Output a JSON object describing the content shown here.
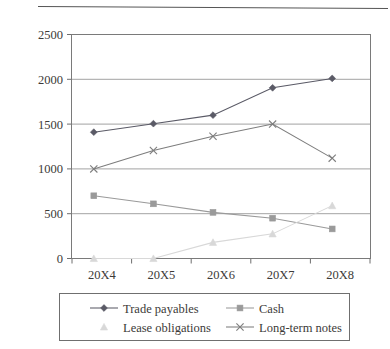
{
  "chart_data": {
    "type": "line",
    "title": "",
    "subtitle": "",
    "xlabel": "",
    "ylabel": "",
    "categories": [
      "20X4",
      "20X5",
      "20X6",
      "20X7",
      "20X8"
    ],
    "ylim": [
      0,
      2500
    ],
    "yticks": [
      0,
      500,
      1000,
      1500,
      2000,
      2500
    ],
    "ytick_labels": [
      "0",
      "500",
      "1000",
      "1500",
      "2000",
      "2500"
    ],
    "grid": true,
    "grid_axis": "y",
    "legend_position": "bottom",
    "series": [
      {
        "name": "Trade payables",
        "marker": "diamond",
        "color": "#5a5a66",
        "values": [
          1410,
          1505,
          1600,
          1905,
          2010
        ]
      },
      {
        "name": "Cash",
        "marker": "square",
        "color": "#9a9a9a",
        "values": [
          700,
          610,
          515,
          450,
          330
        ]
      },
      {
        "name": "Lease obligations",
        "marker": "triangle",
        "color": "#d8d8d8",
        "values": [
          0,
          0,
          180,
          275,
          590
        ]
      },
      {
        "name": "Long-term notes",
        "marker": "x",
        "color": "#7d7d7d",
        "values": [
          1000,
          1205,
          1365,
          1500,
          1120
        ]
      }
    ]
  },
  "legend": {
    "entries": [
      {
        "label": "Trade payables",
        "marker": "diamond",
        "color": "#5a5a66"
      },
      {
        "label": "Cash",
        "marker": "square",
        "color": "#9a9a9a"
      },
      {
        "label": "Lease obligations",
        "marker": "triangle",
        "color": "#d8d8d8"
      },
      {
        "label": "Long-term notes",
        "marker": "x",
        "color": "#7d7d7d"
      }
    ]
  },
  "colors": {
    "background": "#ffffff",
    "grid": "#8a8a8a",
    "axis": "#6e6e6e",
    "text": "#3c3a38",
    "plot_border": "#7a7a7a"
  }
}
